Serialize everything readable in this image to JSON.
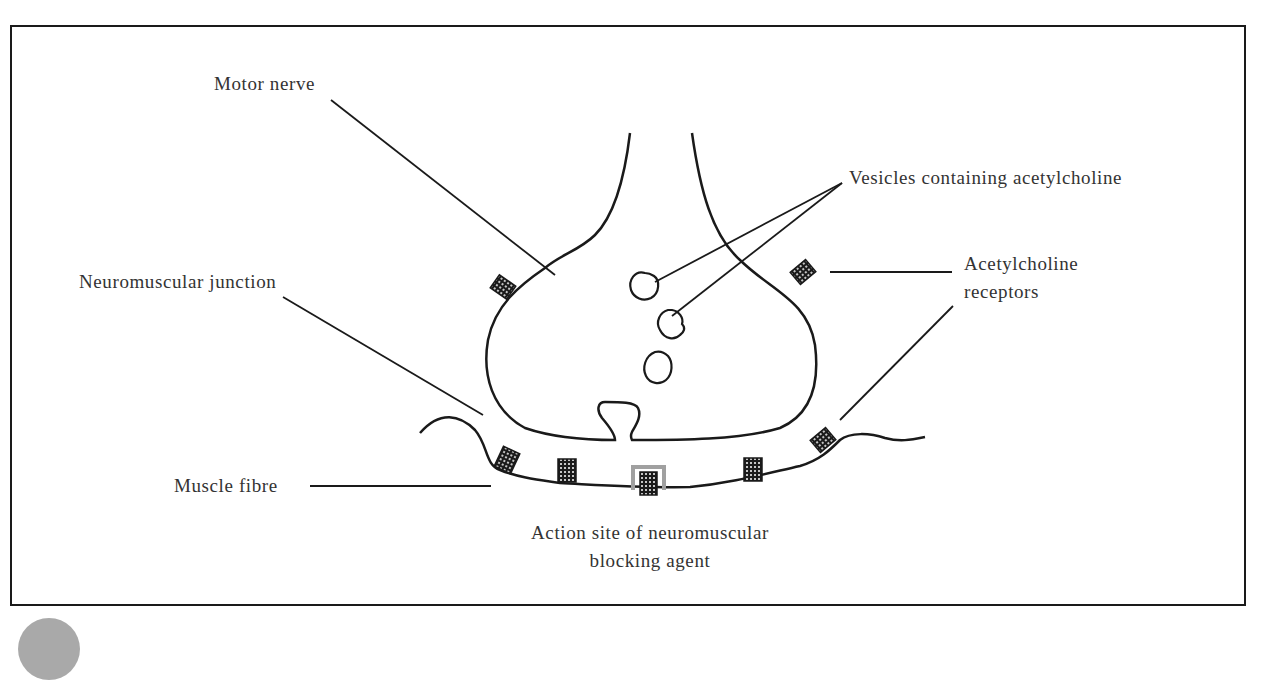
{
  "diagram": {
    "labels": {
      "motor_nerve": "Motor nerve",
      "vesicles": "Vesicles containing acetylcholine",
      "neuromuscular_junction": "Neuromuscular junction",
      "receptors_line1": "Acetylcholine",
      "receptors_line2": "receptors",
      "muscle_fibre": "Muscle fibre",
      "action_site_line1": "Action site of neuromuscular",
      "action_site_line2": "blocking agent"
    },
    "colors": {
      "stroke": "#1a1a1a",
      "text": "#333333",
      "blocking_agent_highlight": "#a0a0a0",
      "receptor_fill": "#1a1a1a"
    },
    "elements": {
      "vesicle_count": 3,
      "receptor_count": 7
    }
  }
}
